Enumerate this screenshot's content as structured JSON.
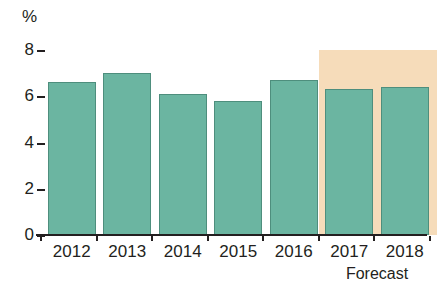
{
  "chart_data": {
    "type": "bar",
    "title": "",
    "subtitle": "",
    "xlabel": "",
    "ylabel": "%",
    "categories": [
      "2012",
      "2013",
      "2014",
      "2015",
      "2016",
      "2017",
      "2018"
    ],
    "values": [
      6.6,
      7.0,
      6.1,
      5.8,
      6.7,
      6.3,
      6.4
    ],
    "series": [
      {
        "name": "Growth rate",
        "values": [
          6.6,
          7.0,
          6.1,
          5.8,
          6.7,
          6.3,
          6.4
        ]
      }
    ],
    "ylim": [
      0,
      8
    ],
    "y_ticks": [
      0,
      2,
      4,
      6,
      8
    ],
    "y_tick_labels": [
      "0",
      "2",
      "4",
      "6",
      "8"
    ],
    "grid": false,
    "legend": false,
    "legend_position": "none",
    "annotations": [
      {
        "text": "Forecast",
        "applies_to": [
          "2017",
          "2018"
        ],
        "position": "below-axis-right"
      }
    ],
    "forecast_categories": [
      "2017",
      "2018"
    ],
    "bar_color": "#6bb5a1",
    "bar_border_color": "#4e8e7d",
    "forecast_band_color": "#f6dcba",
    "axis_color": "#231f20",
    "background_color": "#ffffff"
  },
  "axis": {
    "unit_label": "%",
    "y_tick_labels": [
      "8",
      "6",
      "4",
      "2",
      "0"
    ],
    "x_tick_labels": [
      "2012",
      "2013",
      "2014",
      "2015",
      "2016",
      "2017",
      "2018"
    ]
  },
  "notes": {
    "forecast_label": "Forecast"
  }
}
